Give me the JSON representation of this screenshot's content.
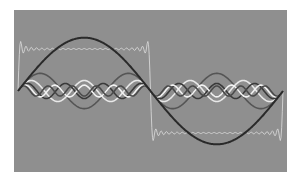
{
  "figure": {
    "background_color": "#ffffff",
    "panel_color": "#8f8f8f"
  },
  "chart_data": {
    "type": "line",
    "title": "",
    "xlabel": "",
    "ylabel": "",
    "grid": false,
    "legend": "none",
    "xlim": [
      0,
      1
    ],
    "ylim": [
      -1.4,
      1.4
    ],
    "series": [
      {
        "name": "square wave (sum)",
        "color": "#d6d6d6",
        "kind": "square",
        "amplitude": 1.0,
        "harmonics_used": 25
      },
      {
        "name": "fundamental (1st harmonic)",
        "color": "#2a2a2a",
        "kind": "sine",
        "harmonic": 1,
        "amplitude": 1.27
      },
      {
        "name": "3rd harmonic",
        "color": "#555555",
        "kind": "sine",
        "harmonic": 3,
        "amplitude": 0.42
      },
      {
        "name": "5th harmonic",
        "color": "#e8e8e8",
        "kind": "sine",
        "harmonic": 5,
        "amplitude": 0.25
      },
      {
        "name": "7th harmonic",
        "color": "#3a3a3a",
        "kind": "sine",
        "harmonic": 7,
        "amplitude": 0.18
      },
      {
        "name": "9th harmonic",
        "color": "#f2f2f2",
        "kind": "sine",
        "harmonic": 9,
        "amplitude": 0.14
      },
      {
        "name": "11th harmonic",
        "color": "#4a4a4a",
        "kind": "sine",
        "harmonic": 11,
        "amplitude": 0.12
      }
    ]
  }
}
